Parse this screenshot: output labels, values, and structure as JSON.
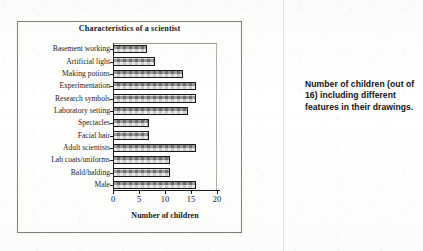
{
  "figure": {
    "title": "Characteristics of a scientist",
    "caption": "Number of children (out of 16) including different features in their drawings."
  },
  "axis": {
    "x_title": "Number of children",
    "x_ticks": [
      "0",
      "5",
      "10",
      "15",
      "20"
    ]
  },
  "chart_data": {
    "type": "bar",
    "orientation": "horizontal",
    "title": "Characteristics of a scientist",
    "xlabel": "Number of children",
    "ylabel": "",
    "xlim": [
      0,
      20
    ],
    "xticks": [
      0,
      5,
      10,
      15,
      20
    ],
    "grid": false,
    "legend": null,
    "annotation": "Number of children (out of 16) including different features in their drawings.",
    "categories": [
      "Basement working",
      "Artificial light",
      "Making potions",
      "Experimentation",
      "Research symbols",
      "Laboratory setting",
      "Spectacles",
      "Facial hair",
      "Adult scientists",
      "Lab coats/uniforms",
      "Bald/balding",
      "Male"
    ],
    "values": [
      6.5,
      8,
      13.5,
      16,
      16,
      14.5,
      7,
      7,
      16,
      11,
      11,
      16
    ],
    "bar_fill": "#a8a8a4",
    "bar_edge": "#171717"
  }
}
